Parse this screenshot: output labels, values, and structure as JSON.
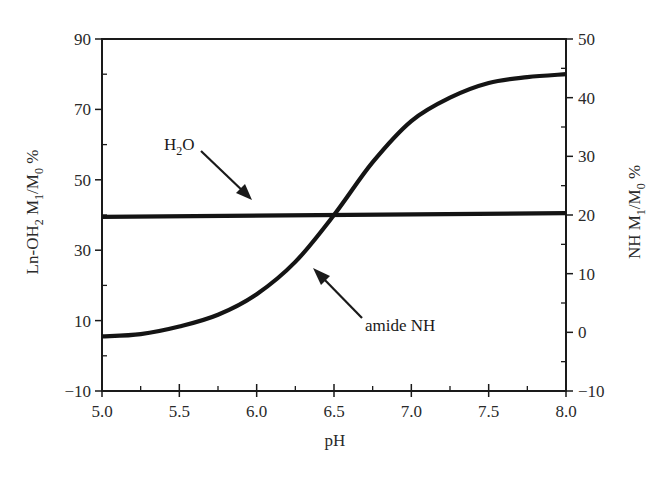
{
  "chart_data": {
    "type": "line",
    "title": "",
    "xlabel": "pH",
    "ylabel_left": "Ln-OH2 M1/M0 %",
    "ylabel_right": "NH M1/M0 %",
    "xlim": [
      5.0,
      8.0
    ],
    "ylim_left": [
      -10,
      90
    ],
    "ylim_right": [
      -10,
      50
    ],
    "x_ticks": [
      "5.0",
      "5.5",
      "6.0",
      "6.5",
      "7.0",
      "7.5",
      "8.0"
    ],
    "y_ticks_left": [
      "90",
      "70",
      "50",
      "30",
      "10",
      "−10"
    ],
    "y_ticks_right": [
      "50",
      "40",
      "30",
      "20",
      "10",
      "0",
      "−10"
    ],
    "grid": false,
    "legend": null,
    "series": [
      {
        "name": "H2O",
        "axis": "left",
        "x": [
          5.0,
          8.0
        ],
        "values": [
          39.5,
          40.5
        ]
      },
      {
        "name": "amide NH",
        "axis": "right",
        "x": [
          5.0,
          5.25,
          5.5,
          5.75,
          6.0,
          6.25,
          6.5,
          6.75,
          7.0,
          7.25,
          7.5,
          7.75,
          8.0
        ],
        "values": [
          -0.7,
          -0.3,
          1.0,
          3.0,
          6.5,
          12.0,
          20.0,
          29.0,
          36.0,
          40.0,
          42.5,
          43.5,
          44.0
        ]
      }
    ],
    "annotations": [
      {
        "text": "H2O",
        "arrow_to": "H2O line near pH 5.9"
      },
      {
        "text": "amide NH",
        "arrow_to": "amide NH curve near pH 6.4"
      }
    ]
  },
  "labels": {
    "xlabel": "pH",
    "ylabel_left_main": "Ln-OH",
    "ylabel_left_sub1": "2",
    "ylabel_left_mid": " M",
    "ylabel_left_sub2": "1",
    "ylabel_left_mid2": "/M",
    "ylabel_left_sub3": "0",
    "ylabel_left_end": " %",
    "ylabel_right_main": "NH M",
    "ylabel_right_sub1": "1",
    "ylabel_right_mid": "/M",
    "ylabel_right_sub2": "0",
    "ylabel_right_end": " %",
    "annot_h2o_main": "H",
    "annot_h2o_sub": "2",
    "annot_h2o_end": "O",
    "annot_amide": "amide NH"
  }
}
